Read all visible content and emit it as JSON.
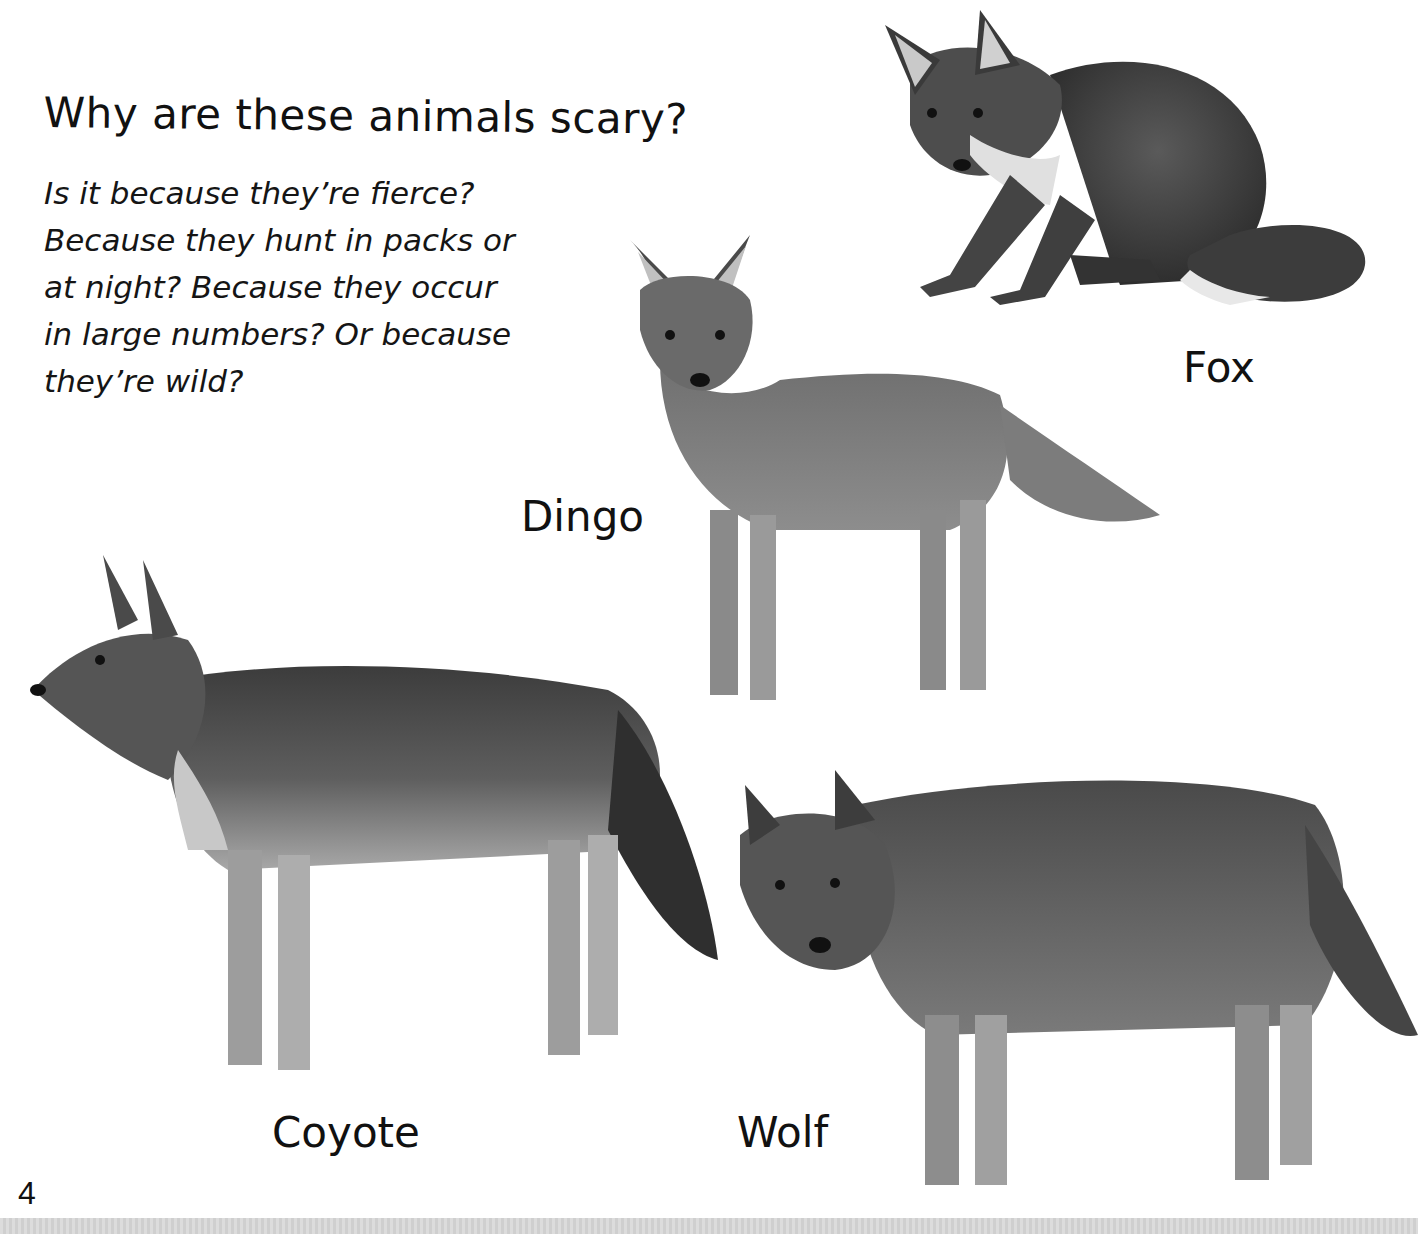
{
  "page": {
    "title": "Why are these animals scary?",
    "body_lines": [
      "Is it because they’re fierce?",
      "Because they hunt in packs or",
      "at night? Because they occur",
      "in large numbers? Or because",
      "they’re wild?"
    ],
    "page_number": "4"
  },
  "illustrations": [
    {
      "name": "fox",
      "label": "Fox",
      "pose": "crouching, facing viewer"
    },
    {
      "name": "dingo",
      "label": "Dingo",
      "pose": "standing, facing viewer"
    },
    {
      "name": "coyote",
      "label": "Coyote",
      "pose": "standing, facing left"
    },
    {
      "name": "wolf",
      "label": "Wolf",
      "pose": "standing, head lowered"
    }
  ],
  "colors": {
    "background": "#ffffff",
    "text": "#111111",
    "fur_dark": "#3a3a3a",
    "fur_mid": "#6e6e6e",
    "fur_light": "#b5b5b5"
  }
}
